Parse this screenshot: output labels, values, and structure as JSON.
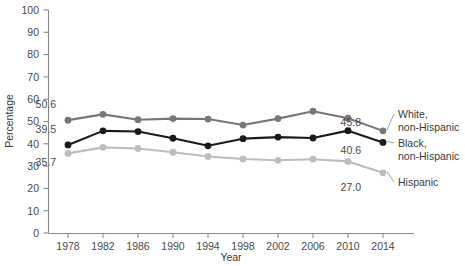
{
  "chart_data": {
    "type": "line",
    "title": "",
    "xlabel": "Year",
    "ylabel": "Percentage",
    "xlim": [
      1976,
      2016
    ],
    "ylim": [
      0,
      100
    ],
    "grid": false,
    "legend_position": "right-inline",
    "categories": [
      1978,
      1982,
      1986,
      1990,
      1994,
      1998,
      2002,
      2006,
      2010,
      2014
    ],
    "x_tick_labels": [
      "1978",
      "1982",
      "1986",
      "1990",
      "1994",
      "1998",
      "2002",
      "2006",
      "2010",
      "2014"
    ],
    "y_tick_labels": [
      "0",
      "10",
      "20",
      "30",
      "40",
      "50",
      "60",
      "70",
      "80",
      "90",
      "100"
    ],
    "y_ticks": [
      0,
      10,
      20,
      30,
      40,
      50,
      60,
      70,
      80,
      90,
      100
    ],
    "series": [
      {
        "name": "White, non-Hispanic",
        "color": "#777777",
        "values": [
          50.6,
          53.2,
          50.8,
          51.3,
          51.1,
          48.4,
          51.3,
          54.6,
          51.5,
          45.8
        ],
        "start_label": "50.6",
        "end_label": "45.8"
      },
      {
        "name": "Black, non-Hispanic",
        "color": "#1a1a1a",
        "values": [
          39.5,
          45.8,
          45.5,
          42.5,
          39.1,
          42.3,
          43.0,
          42.6,
          45.9,
          40.6
        ],
        "start_label": "39.5",
        "end_label": "40.6"
      },
      {
        "name": "Hispanic",
        "color": "#bdbdbd",
        "values": [
          35.7,
          38.4,
          37.9,
          36.2,
          34.3,
          33.2,
          32.6,
          33.1,
          32.1,
          27.0
        ],
        "start_label": "35.7",
        "end_label": "27.0"
      }
    ],
    "annotations": {
      "left_labels": [
        "50.6",
        "39.5",
        "35.7"
      ],
      "right_labels": [
        "45.8",
        "40.6",
        "27.0"
      ],
      "legend_entries": [
        {
          "line1": "White,",
          "line2": "non-Hispanic"
        },
        {
          "line1": "Black,",
          "line2": "non-Hispanic"
        },
        {
          "line1": "Hispanic",
          "line2": ""
        }
      ]
    }
  }
}
